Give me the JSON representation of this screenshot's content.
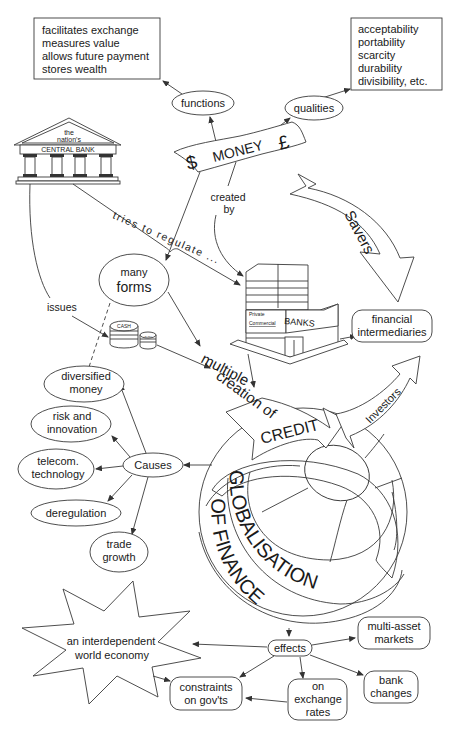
{
  "diagram": {
    "center": {
      "money_label": "MONEY",
      "dollar_symbol": "$",
      "pound_symbol": "£"
    },
    "functions": {
      "label": "functions",
      "items": [
        "facilitates exchange",
        "measures value",
        "allows future payment",
        "stores wealth"
      ]
    },
    "qualities": {
      "label": "qualities",
      "items": [
        "acceptability",
        "portability",
        "scarcity",
        "durability",
        "divisibility, etc."
      ]
    },
    "central_bank": {
      "line1": "the",
      "line2": "nation's",
      "line3": "CENTRAL BANK"
    },
    "edges": {
      "tries_to_regulate": "tries to regulate ...",
      "created_by_1": "created",
      "created_by_2": "by",
      "issues": "issues",
      "multiple_1": "multiple",
      "multiple_2": "creation of"
    },
    "savers": "Savers",
    "investors": "Investors",
    "many_forms": {
      "line1": "many",
      "line2": "forms"
    },
    "cash": {
      "big": "CASH",
      "small": "CASH"
    },
    "banks": {
      "private": "Private",
      "commercial": "Commercial",
      "banks": "BANKS"
    },
    "financial_intermediaries": {
      "line1": "financial",
      "line2": "intermediaries"
    },
    "credit": "CREDIT",
    "causes": {
      "label": "Causes",
      "items": [
        {
          "line1": "diversified",
          "line2": "money"
        },
        {
          "line1": "risk and",
          "line2": "innovation"
        },
        {
          "line1": "telecom.",
          "line2": "technology"
        },
        {
          "line1": "deregulation",
          "line2": ""
        },
        {
          "line1": "trade",
          "line2": "growth"
        }
      ]
    },
    "globe": {
      "line1": "GLOBALISATION",
      "line2": "OF FINANCE"
    },
    "effects": {
      "label": "effects",
      "world_economy": {
        "line1": "an interdependent",
        "line2": "world economy"
      },
      "constraints": {
        "line1": "constraints",
        "line2": "on gov'ts"
      },
      "exchange": {
        "line1": "on",
        "line2": "exchange",
        "line3": "rates"
      },
      "bank_changes": {
        "line1": "bank",
        "line2": "changes"
      },
      "multi_asset": {
        "line1": "multi-asset",
        "line2": "markets"
      }
    }
  }
}
